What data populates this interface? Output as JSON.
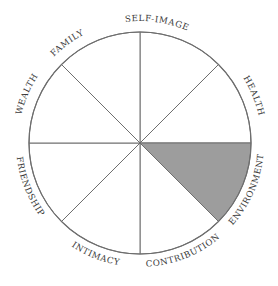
{
  "diagram": {
    "type": "wheel-of-life",
    "center": [
      140,
      143
    ],
    "radius": 111,
    "stroke_color": "#6e6e6e",
    "fill_color": "#ffffff",
    "highlight_color": "#9d9d9d",
    "segments": [
      {
        "label": "SELF-IMAGE",
        "start_deg": 0,
        "end_deg": 45,
        "highlighted": false
      },
      {
        "label": "HEALTH",
        "start_deg": 45,
        "end_deg": 90,
        "highlighted": false
      },
      {
        "label": "FRIENDSHIP",
        "start_deg": 90,
        "end_deg": 135,
        "highlighted": true
      },
      {
        "label": "INTIMACY",
        "start_deg": 135,
        "end_deg": 180,
        "highlighted": false
      },
      {
        "label": "CONTRIBUTION",
        "start_deg": 180,
        "end_deg": 225,
        "highlighted": false
      },
      {
        "label": "ENVIRONMENT",
        "start_deg": 225,
        "end_deg": 270,
        "highlighted": false
      },
      {
        "label": "WEALTH",
        "start_deg": 270,
        "end_deg": 315,
        "highlighted": false
      },
      {
        "label": "FAMILY",
        "start_deg": 315,
        "end_deg": 360,
        "highlighted": false
      }
    ]
  }
}
